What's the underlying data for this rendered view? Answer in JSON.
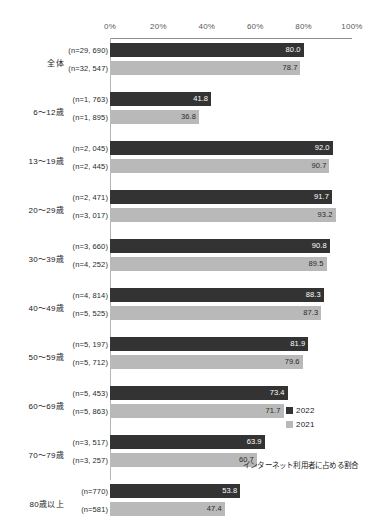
{
  "chart_data": {
    "type": "bar",
    "title": "",
    "xlabel": "",
    "ylabel": "",
    "orientation": "horizontal",
    "xlim": [
      0,
      100
    ],
    "xticks": [
      "0%",
      "20%",
      "40%",
      "60%",
      "80%",
      "100%"
    ],
    "xtick_values": [
      0,
      20,
      40,
      60,
      80,
      100
    ],
    "grid": false,
    "legend_position": "inside-bottom-right",
    "annotation": "インターネット利用者に占める割合",
    "categories": [
      "全体",
      "6～12歳",
      "13～19歳",
      "20～29歳",
      "30～39歳",
      "40～49歳",
      "50～59歳",
      "60～69歳",
      "70～79歳",
      "80歳以上"
    ],
    "series": [
      {
        "name": "2022",
        "color": "#333333",
        "values": [
          80.0,
          41.8,
          92.0,
          91.7,
          90.8,
          88.3,
          81.9,
          73.4,
          63.9,
          53.8
        ],
        "n_labels": [
          "(n=29, 690)",
          "(n=1, 763)",
          "(n=2, 045)",
          "(n=2, 471)",
          "(n=3, 660)",
          "(n=4, 814)",
          "(n=5, 197)",
          "(n=5, 453)",
          "(n=3, 517)",
          "(n=770)"
        ]
      },
      {
        "name": "2021",
        "color": "#b9b9b9",
        "values": [
          78.7,
          36.8,
          90.7,
          93.2,
          89.5,
          87.3,
          79.6,
          71.7,
          60.7,
          47.4
        ],
        "n_labels": [
          "(n=32, 547)",
          "(n=1, 895)",
          "(n=2, 445)",
          "(n=3, 017)",
          "(n=4, 252)",
          "(n=5, 525)",
          "(n=5, 712)",
          "(n=5, 863)",
          "(n=3, 257)",
          "(n=581)"
        ]
      }
    ]
  },
  "legend": {
    "items": [
      {
        "label": "2022",
        "color": "#333333"
      },
      {
        "label": "2021",
        "color": "#b9b9b9"
      }
    ]
  },
  "footnote": "インターネット利用者に占める割合"
}
